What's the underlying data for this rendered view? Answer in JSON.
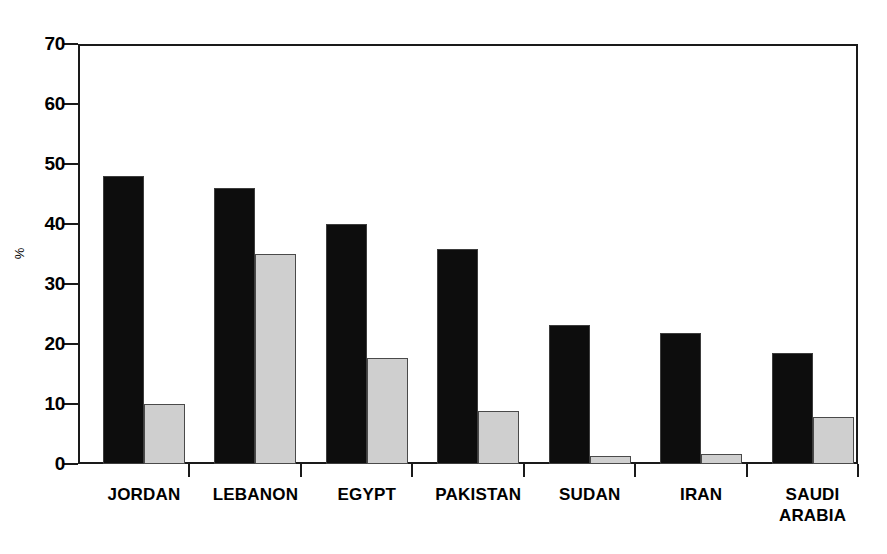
{
  "chart_data": {
    "type": "bar",
    "title": "",
    "subtitle": "",
    "xlabel": "",
    "ylabel": "%",
    "ylim": [
      0,
      70
    ],
    "yticks": [
      0,
      10,
      20,
      30,
      40,
      50,
      60,
      70
    ],
    "ytick_labels": [
      "0",
      "10",
      "20",
      "30",
      "40",
      "50",
      "60",
      "70"
    ],
    "grid": false,
    "legend": "none",
    "categories": [
      "JORDAN",
      "LEBANON",
      "EGYPT",
      "PAKISTAN",
      "SUDAN",
      "IRAN",
      "SAUDI\nARABIA"
    ],
    "series": [
      {
        "name": "series-1",
        "color": "#0d0d0d",
        "values": [
          48.0,
          46.0,
          40.0,
          35.8,
          23.2,
          21.8,
          18.5
        ]
      },
      {
        "name": "series-2",
        "color": "#cfcfcf",
        "values": [
          10.0,
          35.0,
          17.7,
          8.8,
          1.3,
          1.7,
          7.8
        ]
      }
    ]
  },
  "figure": {
    "background_color": "#ffffff",
    "axis_color": "#1a1a1a",
    "bar_dark_color": "#0d0d0d",
    "bar_light_color": "#cfcfcf"
  }
}
